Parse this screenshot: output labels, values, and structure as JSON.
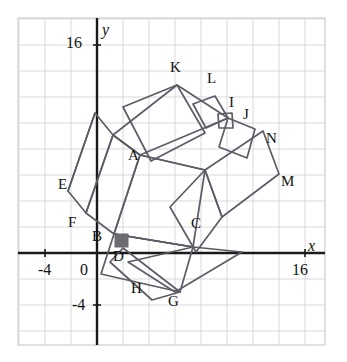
{
  "figure": {
    "width": 347,
    "height": 362,
    "background": "#ffffff"
  },
  "colors": {
    "grid": "#d9d9dc",
    "frame": "#d4d4d8",
    "axis": "#1a1a1a",
    "shape_stroke": "#5c5c66",
    "marker_fill": "#6b6b72",
    "label_text": "#111111"
  },
  "axes": {
    "origin_px": {
      "x": 97,
      "y": 253
    },
    "unit_px": 13,
    "grid_step_units": 2,
    "x_axis": {
      "label": "x",
      "label_pos_px": {
        "x": 308,
        "y": 238
      },
      "tick_labels": [
        {
          "text": "-4",
          "value": -4,
          "pos_px": {
            "x": 38,
            "y": 262
          }
        },
        {
          "text": "0",
          "value": 0,
          "pos_px": {
            "x": 80,
            "y": 262
          }
        },
        {
          "text": "16",
          "value": 16,
          "pos_px": {
            "x": 292,
            "y": 262
          }
        }
      ]
    },
    "y_axis": {
      "label": "y",
      "label_pos_px": {
        "x": 102,
        "y": 22
      },
      "tick_labels": [
        {
          "text": "16",
          "value": 16,
          "pos_px": {
            "x": 66,
            "y": 35
          }
        },
        {
          "text": "-4",
          "value": -4,
          "pos_px": {
            "x": 72,
            "y": 297
          }
        }
      ]
    }
  },
  "chart_data": {
    "type": "scatter",
    "title": "",
    "xlabel": "x",
    "ylabel": "y",
    "xlim": [
      -6,
      17.5
    ],
    "ylim": [
      -7,
      18
    ],
    "grid": true,
    "legend": null,
    "points": [
      {
        "label": "A",
        "x": 3.3,
        "y": 7.5,
        "label_px": {
          "x": 128,
          "y": 148
        }
      },
      {
        "label": "B",
        "x": 0.6,
        "y": 1.4,
        "label_px": {
          "x": 92,
          "y": 229
        }
      },
      {
        "label": "C",
        "x": 7.9,
        "y": 2.4,
        "label_px": {
          "x": 191,
          "y": 216
        }
      },
      {
        "label": "D",
        "x": 1.7,
        "y": 0.0,
        "label_px": {
          "x": 113,
          "y": 249
        }
      },
      {
        "label": "E",
        "x": -2.3,
        "y": 5.3,
        "label_px": {
          "x": 58,
          "y": 177
        }
      },
      {
        "label": "F",
        "x": -1.5,
        "y": 2.4,
        "label_px": {
          "x": 68,
          "y": 215
        }
      },
      {
        "label": "G",
        "x": 6.0,
        "y": -3.6,
        "label_px": {
          "x": 168,
          "y": 294
        }
      },
      {
        "label": "H",
        "x": 3.1,
        "y": -2.6,
        "label_px": {
          "x": 131,
          "y": 281
        }
      },
      {
        "label": "I",
        "x": 10.7,
        "y": 11.0,
        "label_px": {
          "x": 229,
          "y": 95
        }
      },
      {
        "label": "J",
        "x": 12.0,
        "y": 10.2,
        "label_px": {
          "x": 243,
          "y": 107
        }
      },
      {
        "label": "K",
        "x": 6.2,
        "y": 13.4,
        "label_px": {
          "x": 170,
          "y": 60
        }
      },
      {
        "label": "L",
        "x": 9.0,
        "y": 12.5,
        "label_px": {
          "x": 207,
          "y": 71
        }
      },
      {
        "label": "M",
        "x": 14.7,
        "y": 5.5,
        "label_px": {
          "x": 281,
          "y": 174
        }
      },
      {
        "label": "N",
        "x": 13.5,
        "y": 8.8,
        "label_px": {
          "x": 266,
          "y": 131
        }
      }
    ],
    "marker": {
      "name": "filled-square-marker",
      "pos_px": {
        "x": 115,
        "y": 234
      },
      "size_px": 13,
      "fill": "#6b6b72"
    },
    "polylines": [
      {
        "name": "square-ABCD-core",
        "closed": true,
        "points_px": [
          [
            140,
            155
          ],
          [
            114,
            234
          ],
          [
            193,
            247
          ],
          [
            205,
            170
          ]
        ]
      },
      {
        "name": "square-on-AB-left",
        "closed": true,
        "points_px": [
          [
            140,
            155
          ],
          [
            114,
            234
          ],
          [
            86,
            213
          ],
          [
            113,
            135
          ]
        ]
      },
      {
        "name": "square-E-F-outer",
        "closed": true,
        "points_px": [
          [
            113,
            135
          ],
          [
            86,
            213
          ],
          [
            68,
            191
          ],
          [
            95,
            113
          ]
        ]
      },
      {
        "name": "square-ADH-lower",
        "closed": true,
        "points_px": [
          [
            114,
            234
          ],
          [
            193,
            247
          ],
          [
            180,
            292
          ],
          [
            101,
            274
          ]
        ]
      },
      {
        "name": "square-DGH",
        "closed": true,
        "points_px": [
          [
            123,
            248
          ],
          [
            180,
            292
          ],
          [
            152,
            300
          ],
          [
            110,
            262
          ]
        ]
      },
      {
        "name": "square-K-upper-left",
        "closed": true,
        "points_px": [
          [
            140,
            155
          ],
          [
            113,
            135
          ],
          [
            177,
            85
          ],
          [
            228,
            118
          ]
        ]
      },
      {
        "name": "square-K-outer",
        "closed": true,
        "points_px": [
          [
            123,
            107
          ],
          [
            177,
            85
          ],
          [
            205,
            133
          ],
          [
            151,
            161
          ]
        ]
      },
      {
        "name": "square-L-small",
        "closed": true,
        "points_px": [
          [
            193,
            104
          ],
          [
            215,
            96
          ],
          [
            228,
            118
          ],
          [
            206,
            128
          ]
        ]
      },
      {
        "name": "square-IJ-small",
        "closed": true,
        "points_px": [
          [
            218,
            114
          ],
          [
            232,
            113
          ],
          [
            233,
            128
          ],
          [
            219,
            128
          ]
        ]
      },
      {
        "name": "square-J-N-right",
        "closed": true,
        "points_px": [
          [
            228,
            118
          ],
          [
            255,
            129
          ],
          [
            247,
            158
          ],
          [
            219,
            147
          ]
        ]
      },
      {
        "name": "square-M-right-big",
        "closed": true,
        "points_px": [
          [
            205,
            170
          ],
          [
            263,
            131
          ],
          [
            279,
            174
          ],
          [
            222,
            217
          ]
        ]
      },
      {
        "name": "square-C-M-lower-right",
        "closed": true,
        "points_px": [
          [
            205,
            170
          ],
          [
            222,
            217
          ],
          [
            196,
            252
          ],
          [
            170,
            207
          ]
        ]
      },
      {
        "name": "square-C-G-band",
        "closed": true,
        "points_px": [
          [
            193,
            247
          ],
          [
            242,
            252
          ],
          [
            175,
            292
          ],
          [
            128,
            262
          ]
        ]
      },
      {
        "name": "diag-A-C",
        "closed": false,
        "points_px": [
          [
            140,
            155
          ],
          [
            205,
            170
          ]
        ]
      },
      {
        "name": "diag-B-C",
        "closed": false,
        "points_px": [
          [
            114,
            234
          ],
          [
            193,
            247
          ]
        ]
      },
      {
        "name": "edge-E-B",
        "closed": false,
        "points_px": [
          [
            68,
            191
          ],
          [
            95,
            113
          ]
        ]
      }
    ]
  }
}
